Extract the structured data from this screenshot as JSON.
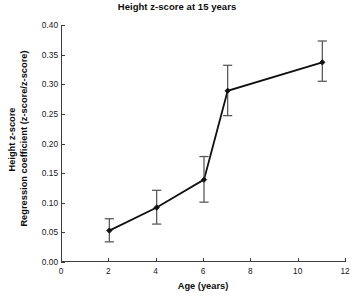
{
  "chart_data": {
    "type": "line",
    "title": "Height z-score at 15 years",
    "xlabel": "Age (years)",
    "ylabel_line1": "Height z-score",
    "ylabel_line2": "Regression coefficient (z-score/z-score)",
    "xlim": [
      0,
      12
    ],
    "ylim": [
      0.0,
      0.4
    ],
    "xticks": [
      0,
      2,
      4,
      6,
      8,
      10,
      12
    ],
    "xtick_labels": [
      "0",
      "2",
      "4",
      "6",
      "8",
      "10",
      "12"
    ],
    "yticks": [
      0.0,
      0.05,
      0.1,
      0.15,
      0.2,
      0.25,
      0.3,
      0.35,
      0.4
    ],
    "ytick_labels": [
      "0.00",
      "0.05",
      "0.10",
      "0.15",
      "0.20",
      "0.25",
      "0.30",
      "0.35",
      "0.40"
    ],
    "grid": false,
    "legend": "none",
    "x": [
      2,
      4,
      6,
      7,
      11
    ],
    "values": [
      0.053,
      0.092,
      0.139,
      0.289,
      0.337
    ],
    "error_low": [
      0.034,
      0.064,
      0.101,
      0.247,
      0.305
    ],
    "error_high": [
      0.073,
      0.121,
      0.178,
      0.332,
      0.373
    ],
    "marker": "filled-diamond",
    "line_color": "#111111",
    "marker_color": "#111111",
    "errorbar_color": "#555555"
  }
}
